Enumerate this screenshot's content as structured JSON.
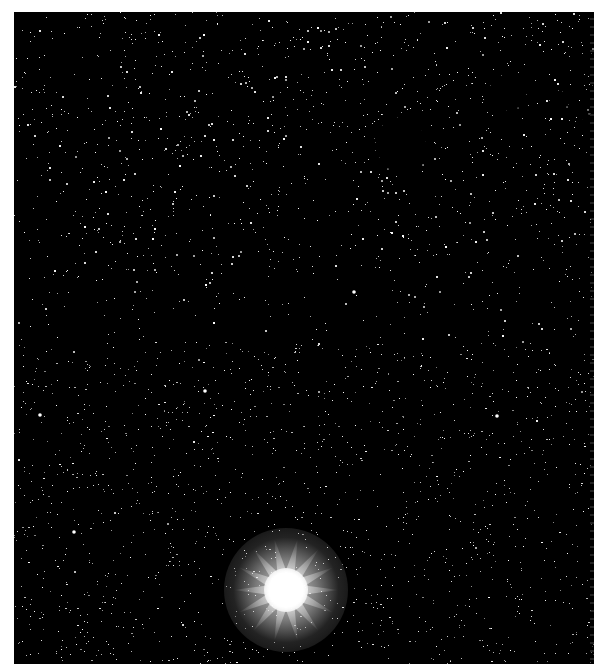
{
  "image": {
    "description": "Astronomical photograph of a dense star field with nebulosity",
    "frame": {
      "x": 14,
      "y": 12,
      "width": 580,
      "height": 652,
      "border_color": "#ffffff",
      "sky_color": "#000000"
    },
    "bright_star": {
      "cx": 272,
      "cy": 578,
      "core_radius": 22,
      "halo_radius": 62,
      "color": "#ffffff"
    },
    "nebulosity_regions": [
      {
        "cx": 150,
        "cy": 70,
        "rx": 200,
        "ry": 120,
        "opacity": 0.55
      },
      {
        "cx": 470,
        "cy": 180,
        "rx": 160,
        "ry": 140,
        "opacity": 0.55
      },
      {
        "cx": 110,
        "cy": 240,
        "rx": 90,
        "ry": 70,
        "opacity": 0.45
      },
      {
        "cx": 520,
        "cy": 60,
        "rx": 120,
        "ry": 80,
        "opacity": 0.5
      },
      {
        "cx": 330,
        "cy": 40,
        "rx": 140,
        "ry": 60,
        "opacity": 0.4
      }
    ],
    "dark_globules": [
      {
        "x": 364,
        "y": 118,
        "w": 48,
        "h": 54
      },
      {
        "x": 476,
        "y": 78,
        "w": 34,
        "h": 32
      },
      {
        "x": 540,
        "y": 92,
        "w": 16,
        "h": 14
      },
      {
        "x": 568,
        "y": 114,
        "w": 8,
        "h": 8
      }
    ]
  }
}
